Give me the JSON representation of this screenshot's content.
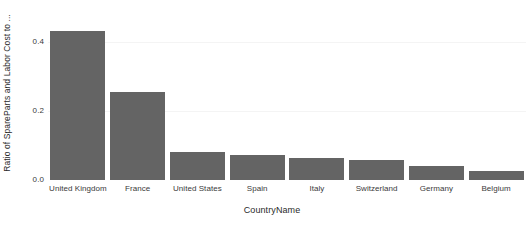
{
  "chart_data": {
    "type": "bar",
    "title": "",
    "xlabel": "CountryName",
    "ylabel": "Ratio of SpareParts and Labor Cost to ...",
    "categories": [
      "United Kingdom",
      "France",
      "United States",
      "Spain",
      "Italy",
      "Switzerland",
      "Germany",
      "Belgium"
    ],
    "values": [
      0.432,
      0.255,
      0.081,
      0.072,
      0.064,
      0.058,
      0.04,
      0.026
    ],
    "ylim": [
      0.0,
      0.46
    ],
    "yticks": [
      0.0,
      0.2,
      0.4
    ],
    "ytick_labels": [
      "0.0",
      "0.2",
      "0.4"
    ],
    "grid": true,
    "legend": "none",
    "bar_color": "#646464",
    "background_color": "#ffffff",
    "gridline_color": "#f4f4f4",
    "axis_text_color": "#3a3a3a"
  }
}
